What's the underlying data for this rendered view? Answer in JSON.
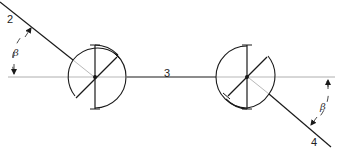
{
  "diagram": {
    "type": "mechanical linkage - two joints connected by shaft",
    "labels": {
      "link_left": "2",
      "link_middle": "3",
      "link_right": "4",
      "angle_left": "β",
      "angle_right": "β"
    },
    "joints": [
      {
        "name": "left-joint",
        "cx": 95,
        "cy": 77,
        "r": 31
      },
      {
        "name": "right-joint",
        "cx": 247,
        "cy": 77,
        "r": 31
      }
    ],
    "colors": {
      "stroke": "#1a1a1a",
      "centerline": "#9a9a9a",
      "background": "#ffffff"
    }
  }
}
